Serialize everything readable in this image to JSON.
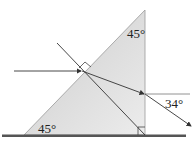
{
  "diagram": {
    "type": "optics-prism-refraction",
    "labels": {
      "top_angle": "45°",
      "bottom_angle": "45°",
      "exit_angle": "34°"
    },
    "colors": {
      "prism_fill": "#e4e4e4",
      "line": "#333333",
      "ground": "#555555"
    }
  }
}
